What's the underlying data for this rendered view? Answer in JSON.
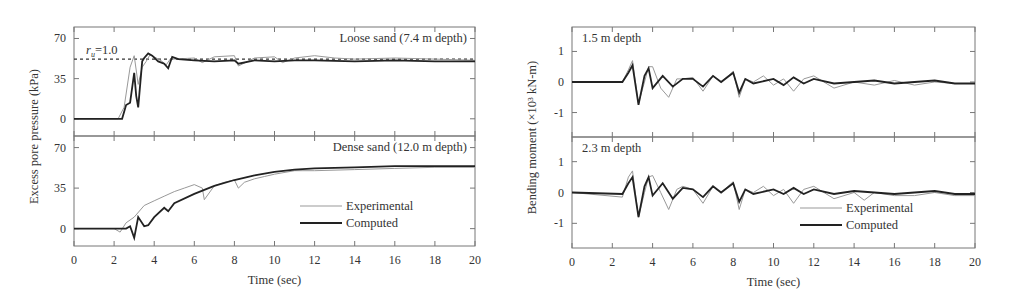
{
  "chart_data": [
    {
      "type": "line",
      "title": "",
      "xlabel": "Time (sec)",
      "ylabel": "Excess pore pressure (kPa)",
      "xlim": [
        0,
        20
      ],
      "xticks": [
        "0",
        "2",
        "4",
        "6",
        "8",
        "10",
        "12",
        "14",
        "16",
        "18",
        "20"
      ],
      "legend": {
        "position": "lower right (bottom panel)",
        "entries": [
          "Experimental",
          "Computed"
        ]
      },
      "panels": [
        {
          "label": "Loose sand (7.4 m depth)",
          "ylim": [
            -15,
            80
          ],
          "yticks": [
            "0",
            "35",
            "70"
          ],
          "reference_line": {
            "label": "r_u=1.0",
            "y": 52
          },
          "series": [
            {
              "name": "Experimental",
              "x": [
                0,
                2.2,
                2.5,
                2.8,
                3.0,
                3.2,
                3.4,
                3.6,
                3.8,
                4.0,
                4.4,
                4.6,
                4.8,
                5,
                6,
                6.4,
                7,
                8,
                8.2,
                9,
                10,
                10.4,
                11,
                12,
                13,
                14,
                16,
                18,
                20
              ],
              "y": [
                0,
                0,
                10,
                45,
                55,
                30,
                45,
                50,
                56,
                54,
                50,
                47,
                52,
                52,
                53,
                49,
                54,
                55,
                46,
                53,
                54,
                49,
                53,
                55,
                53,
                52,
                53,
                52,
                51
              ]
            },
            {
              "name": "Computed",
              "x": [
                0,
                2.4,
                2.6,
                2.8,
                3.0,
                3.1,
                3.2,
                3.4,
                3.5,
                3.7,
                3.9,
                4.2,
                4.5,
                4.7,
                4.9,
                5.2,
                6,
                7,
                8,
                8.2,
                9,
                10,
                11,
                12,
                14,
                16,
                18,
                20
              ],
              "y": [
                0,
                0,
                12,
                14,
                40,
                20,
                10,
                50,
                53,
                57,
                55,
                50,
                48,
                44,
                54,
                52,
                51,
                50,
                51,
                48,
                51,
                50,
                51,
                51,
                50,
                51,
                50,
                50
              ]
            }
          ]
        },
        {
          "label": "Dense sand (12.0 m depth)",
          "ylim": [
            -15,
            80
          ],
          "yticks": [
            "0",
            "35",
            "70"
          ],
          "series": [
            {
              "name": "Experimental",
              "x": [
                0,
                2,
                2.3,
                2.6,
                3,
                3.5,
                4,
                4.5,
                5,
                5.5,
                6,
                6.4,
                6.5,
                7,
                7.5,
                8,
                8.2,
                8.5,
                9,
                9.5,
                10,
                11,
                12,
                14,
                16,
                18,
                20
              ],
              "y": [
                0,
                0,
                -3,
                5,
                10,
                20,
                24,
                28,
                32,
                35,
                38,
                35,
                25,
                37,
                40,
                42,
                35,
                40,
                43,
                45,
                47,
                50,
                50,
                51,
                52,
                53,
                53
              ]
            },
            {
              "name": "Computed",
              "x": [
                0,
                2.6,
                2.8,
                3.0,
                3.2,
                3.5,
                3.7,
                4,
                4.5,
                4.7,
                5,
                6,
                7,
                8,
                9,
                10,
                11,
                12,
                14,
                16,
                18,
                20
              ],
              "y": [
                0,
                0,
                2,
                -8,
                10,
                2,
                3,
                10,
                18,
                15,
                22,
                30,
                37,
                42,
                46,
                49,
                51,
                52,
                53,
                54,
                54,
                54
              ]
            }
          ]
        }
      ]
    },
    {
      "type": "line",
      "title": "",
      "xlabel": "Time (sec)",
      "ylabel": "Bending moment (×10³ kN-m)",
      "xlim": [
        0,
        20
      ],
      "xticks": [
        "0",
        "2",
        "4",
        "6",
        "8",
        "10",
        "12",
        "14",
        "16",
        "18",
        "20"
      ],
      "legend": {
        "position": "lower right (bottom panel)",
        "entries": [
          "Experimental",
          "Computed"
        ]
      },
      "panels": [
        {
          "label": "1.5 m depth",
          "ylim": [
            -1.8,
            1.8
          ],
          "yticks": [
            "1",
            "0",
            "-1"
          ],
          "series": [
            {
              "name": "Experimental",
              "x": [
                0,
                2.5,
                2.8,
                3.0,
                3.3,
                3.6,
                3.8,
                4.0,
                4.4,
                4.8,
                5.2,
                5.5,
                6,
                6.5,
                7,
                7.4,
                8,
                8.3,
                8.6,
                9,
                9.5,
                10,
                10.5,
                11,
                11.5,
                12,
                13,
                14,
                15,
                16,
                17,
                18,
                19,
                20
              ],
              "y": [
                0,
                0,
                0.4,
                0.7,
                -0.7,
                0,
                0.5,
                0.5,
                -0.2,
                -0.5,
                0.1,
                0.1,
                0.15,
                -0.3,
                0.2,
                0,
                0.35,
                -0.5,
                0.1,
                0,
                0.2,
                -0.1,
                0.1,
                -0.3,
                0.1,
                0.2,
                -0.2,
                0,
                -0.1,
                0.05,
                -0.1,
                0,
                -0.05,
                -0.05
              ]
            },
            {
              "name": "Computed",
              "x": [
                0,
                2.5,
                2.8,
                3.0,
                3.3,
                3.6,
                3.8,
                4.0,
                4.5,
                5,
                5.5,
                6,
                6.5,
                7,
                7.4,
                8,
                8.3,
                8.6,
                9,
                10,
                10.5,
                11,
                11.5,
                12,
                13,
                14,
                15,
                16,
                17,
                18,
                19,
                20
              ],
              "y": [
                0,
                0,
                0.3,
                0.55,
                -0.75,
                0.2,
                0.45,
                -0.2,
                0.2,
                -0.15,
                0.1,
                0.1,
                -0.15,
                0.2,
                0,
                0.3,
                -0.35,
                0.1,
                -0.05,
                0.1,
                -0.1,
                0.15,
                -0.05,
                0.1,
                -0.05,
                0,
                0.05,
                -0.05,
                0,
                0.05,
                -0.05,
                -0.05
              ]
            }
          ]
        },
        {
          "label": "2.3 m depth",
          "ylim": [
            -1.8,
            1.8
          ],
          "yticks": [
            "1",
            "0",
            "-1"
          ],
          "series": [
            {
              "name": "Experimental",
              "x": [
                0,
                2.5,
                2.8,
                3.0,
                3.3,
                3.6,
                3.8,
                4.0,
                4.4,
                4.8,
                5.2,
                5.5,
                6,
                6.5,
                7,
                7.4,
                8,
                8.3,
                8.6,
                9,
                9.5,
                10,
                10.5,
                11,
                11.5,
                12,
                13,
                14,
                14.5,
                15,
                16,
                17,
                18,
                19,
                20
              ],
              "y": [
                0,
                -0.15,
                0.5,
                0.7,
                -0.8,
                0,
                0.5,
                0.55,
                0,
                -0.55,
                0.1,
                0.2,
                0.1,
                -0.35,
                0.2,
                0,
                0.35,
                -0.55,
                0.1,
                0,
                0.2,
                -0.1,
                0.1,
                -0.35,
                0.1,
                0.2,
                -0.2,
                0,
                -0.25,
                0,
                -0.1,
                -0.1,
                0,
                -0.1,
                -0.1
              ]
            },
            {
              "name": "Computed",
              "x": [
                0,
                2.5,
                2.8,
                3.0,
                3.3,
                3.6,
                3.8,
                4.0,
                4.5,
                5,
                5.5,
                6,
                6.5,
                7,
                7.4,
                8,
                8.3,
                8.6,
                9,
                10,
                10.5,
                11,
                11.5,
                12,
                13,
                14,
                15,
                16,
                17,
                18,
                19,
                20
              ],
              "y": [
                0,
                -0.05,
                0.3,
                0.5,
                -0.8,
                0.2,
                0.5,
                -0.1,
                0.3,
                -0.2,
                0.15,
                0.1,
                -0.15,
                0.2,
                0,
                0.3,
                -0.3,
                0.1,
                -0.05,
                0.1,
                -0.05,
                0.15,
                -0.05,
                0.1,
                -0.05,
                0.05,
                0,
                -0.05,
                0,
                0.05,
                -0.05,
                -0.05
              ]
            }
          ]
        }
      ]
    }
  ]
}
